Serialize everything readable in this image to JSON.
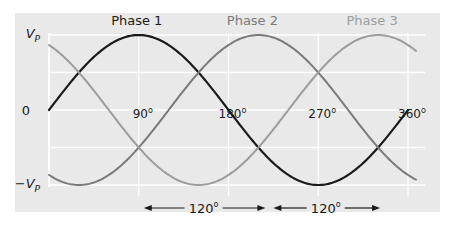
{
  "chart_data": {
    "type": "line",
    "title": "",
    "xlabel": "",
    "ylabel": "",
    "x_unit": "degrees",
    "xlim": [
      0,
      368
    ],
    "ylim": [
      -1,
      1
    ],
    "grid": true,
    "y_ticks": [
      {
        "value": 1,
        "label_main": "V",
        "label_sub": "P",
        "label_prefix": ""
      },
      {
        "value": 0,
        "label_main": "0",
        "label_sub": "",
        "label_prefix": ""
      },
      {
        "value": -1,
        "label_main": "V",
        "label_sub": "P",
        "label_prefix": "−"
      }
    ],
    "x_ticks": [
      {
        "value": 90,
        "label": "90",
        "sup": "o"
      },
      {
        "value": 180,
        "label": "180",
        "sup": "o"
      },
      {
        "value": 270,
        "label": "270",
        "sup": "o"
      },
      {
        "value": 360,
        "label": "360",
        "sup": "o"
      }
    ],
    "series": [
      {
        "name": "Phase 1",
        "function": "sin",
        "phase_shift_deg": 0,
        "amplitude": 1,
        "x_start": 0,
        "x_end": 360,
        "color": "#1a1a1a",
        "label": "Phase 1"
      },
      {
        "name": "Phase 2",
        "function": "sin",
        "phase_shift_deg": 120,
        "amplitude": 1,
        "x_start": 0,
        "x_end": 368,
        "color": "#7a7a7a",
        "label": "Phase 2"
      },
      {
        "name": "Phase 3",
        "function": "sin",
        "phase_shift_deg": 240,
        "amplitude": 1,
        "x_start": 0,
        "x_end": 368,
        "color": "#9c9c9c",
        "label": "Phase 3"
      }
    ],
    "annotations": [
      {
        "type": "span-arrow",
        "from_deg": 90,
        "to_deg": 220,
        "label": "120",
        "sup": "o"
      },
      {
        "type": "span-arrow",
        "from_deg": 220,
        "to_deg": 335,
        "label": "120",
        "sup": "o"
      }
    ]
  },
  "colors": {
    "background_panel": "#e9e9e9",
    "grid": "#ffffff",
    "text": "#1a1a1a"
  }
}
